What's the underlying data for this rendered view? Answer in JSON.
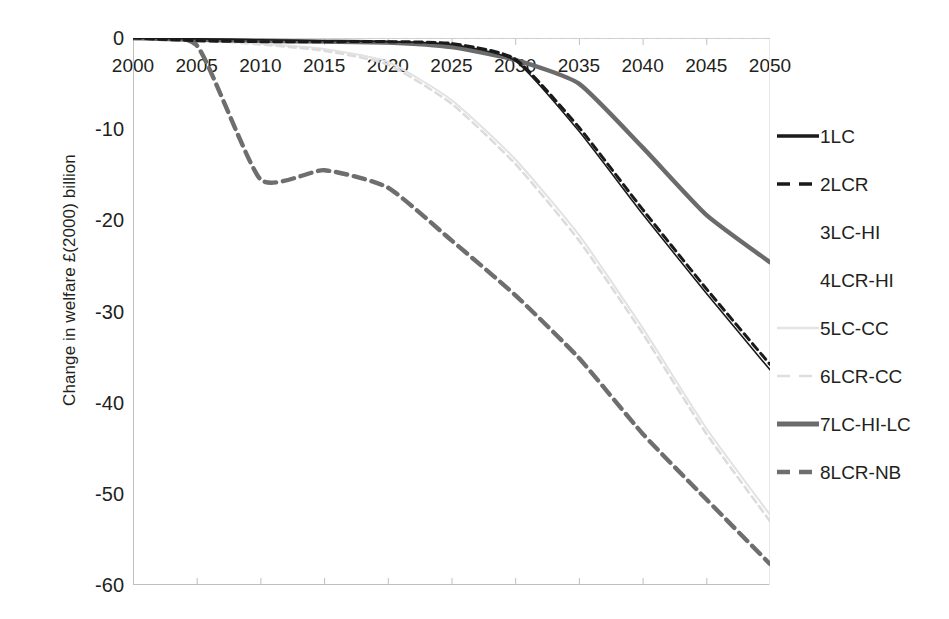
{
  "chart_data": {
    "type": "line",
    "title": "",
    "xlabel": "",
    "ylabel": "Change in welfare £(2000) billion",
    "xlim": [
      2000,
      2050
    ],
    "ylim": [
      -60,
      0
    ],
    "grid": false,
    "legend_position": "right",
    "x_ticks": [
      "2000",
      "2005",
      "2010",
      "2015",
      "2020",
      "2025",
      "2030",
      "2035",
      "2040",
      "2045",
      "2050"
    ],
    "y_ticks": [
      "0",
      "-10",
      "-20",
      "-30",
      "-40",
      "-50",
      "-60"
    ],
    "x": [
      2000,
      2005,
      2010,
      2015,
      2020,
      2025,
      2030,
      2035,
      2040,
      2045,
      2050
    ],
    "series": [
      {
        "name": "1LC",
        "style": "solid",
        "color": "#1a1a1a",
        "width": 1.6,
        "values": [
          0,
          -0.1,
          -0.2,
          -0.3,
          -0.4,
          -0.7,
          -2.5,
          -10.2,
          -19.3,
          -28.0,
          -36.4
        ]
      },
      {
        "name": "2LCR",
        "style": "dashed",
        "color": "#1a1a1a",
        "width": 3.0,
        "values": [
          0,
          -0.3,
          -0.4,
          -0.4,
          -0.4,
          -0.6,
          -2.3,
          -9.8,
          -18.8,
          -27.5,
          -35.8
        ]
      },
      {
        "name": "3LC-HI",
        "style": "solid",
        "color": "#d9d9d9",
        "width": 1.0,
        "values": [
          0,
          0,
          0,
          0,
          0,
          0,
          0,
          0,
          0,
          0,
          0
        ]
      },
      {
        "name": "4LCR-HI",
        "style": "dashed",
        "color": "#d9d9d9",
        "width": 1.0,
        "values": [
          0,
          0,
          0,
          0,
          0,
          0,
          0,
          0,
          0,
          0,
          0
        ]
      },
      {
        "name": "5LC-CC",
        "style": "solid",
        "color": "#e2e2e2",
        "width": 2.0,
        "values": [
          0,
          -0.2,
          -0.6,
          -1.2,
          -2.6,
          -6.8,
          -13.3,
          -21.6,
          -31.8,
          -42.8,
          -52.3
        ]
      },
      {
        "name": "6LCR-CC",
        "style": "dashed",
        "color": "#dcdcdc",
        "width": 2.6,
        "values": [
          0,
          -0.2,
          -0.7,
          -1.4,
          -2.9,
          -7.2,
          -13.8,
          -22.2,
          -32.4,
          -43.4,
          -53.0
        ]
      },
      {
        "name": "7LC-HI-LC",
        "style": "solid",
        "color": "#6b6b6b",
        "width": 4.4,
        "values": [
          0,
          -0.2,
          -0.3,
          -0.4,
          -0.5,
          -1.0,
          -2.4,
          -5.0,
          -12.0,
          -19.4,
          -24.6
        ]
      },
      {
        "name": "8LCR-NB",
        "style": "dashed",
        "color": "#6e6e6e",
        "width": 4.4,
        "values": [
          0,
          -0.8,
          -15.5,
          -14.5,
          -16.4,
          -22.2,
          -28.2,
          -35.1,
          -43.4,
          -50.6,
          -57.7
        ]
      }
    ]
  },
  "axes": {
    "y_title": "Change in welfare £(2000) billion",
    "y_ticks": [
      {
        "label": "0",
        "value": 0
      },
      {
        "label": "-10",
        "value": -10
      },
      {
        "label": "-20",
        "value": -20
      },
      {
        "label": "-30",
        "value": -30
      },
      {
        "label": "-40",
        "value": -40
      },
      {
        "label": "-50",
        "value": -50
      },
      {
        "label": "-60",
        "value": -60
      }
    ],
    "x_ticks": [
      {
        "label": "2000",
        "value": 2000
      },
      {
        "label": "2005",
        "value": 2005
      },
      {
        "label": "2010",
        "value": 2010
      },
      {
        "label": "2015",
        "value": 2015
      },
      {
        "label": "2020",
        "value": 2020
      },
      {
        "label": "2025",
        "value": 2025
      },
      {
        "label": "2030",
        "value": 2030
      },
      {
        "label": "2035",
        "value": 2035
      },
      {
        "label": "2040",
        "value": 2040
      },
      {
        "label": "2045",
        "value": 2045
      },
      {
        "label": "2050",
        "value": 2050
      }
    ],
    "axis_color": "#bfbfbf"
  },
  "legend": {
    "items": [
      {
        "label": "1LC",
        "style": "solid",
        "color": "#1a1a1a",
        "width": 3.4
      },
      {
        "label": "2LCR",
        "style": "dashed",
        "color": "#1a1a1a",
        "width": 3.6
      },
      {
        "label": "3LC-HI",
        "style": "solid",
        "color": "#ffffff",
        "width": 0
      },
      {
        "label": "4LCR-HI",
        "style": "solid",
        "color": "#ffffff",
        "width": 0
      },
      {
        "label": "5LC-CC",
        "style": "solid",
        "color": "#e4e4e4",
        "width": 2.4
      },
      {
        "label": "6LCR-CC",
        "style": "dashed",
        "color": "#dedede",
        "width": 2.6
      },
      {
        "label": "7LC-HI-LC",
        "style": "solid",
        "color": "#6b6b6b",
        "width": 5.0
      },
      {
        "label": "8LCR-NB",
        "style": "dashed",
        "color": "#6e6e6e",
        "width": 4.4
      }
    ]
  }
}
